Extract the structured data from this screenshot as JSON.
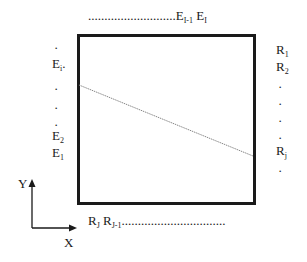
{
  "diagram": {
    "type": "grid-edge-labels",
    "top_labels": {
      "leader": "...........................",
      "items": [
        {
          "base": "E",
          "sub": "I-1"
        },
        {
          "base": "E",
          "sub": "I"
        }
      ]
    },
    "left_labels": {
      "items": [
        {
          "base": "E",
          "sub": "i"
        },
        {
          "base": "E",
          "sub": "2"
        },
        {
          "base": "E",
          "sub": "1"
        }
      ]
    },
    "right_labels": {
      "items": [
        {
          "base": "R",
          "sub": "1"
        },
        {
          "base": "R",
          "sub": "2"
        },
        {
          "base": "R",
          "sub": "j"
        }
      ]
    },
    "bottom_labels": {
      "items": [
        {
          "base": "R",
          "sub": "J"
        },
        {
          "base": "R",
          "sub": "J-1"
        }
      ],
      "leader": "................................"
    },
    "axes": {
      "x_label": "X",
      "y_label": "Y"
    },
    "box": {
      "x": 77,
      "y": 34,
      "width": 178,
      "height": 170,
      "stroke": "#1a1a1a"
    },
    "ray": {
      "x1": 79,
      "y1": 85,
      "x2": 253,
      "y2": 156,
      "stroke": "#888888"
    }
  }
}
